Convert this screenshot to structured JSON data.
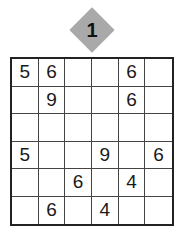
{
  "puzzle": {
    "number": "1",
    "badge_color": "#a9a9a9",
    "size": 6,
    "grid": [
      [
        "5",
        "6",
        "",
        "",
        "6",
        ""
      ],
      [
        "",
        "9",
        "",
        "",
        "6",
        ""
      ],
      [
        "",
        "",
        "",
        "",
        "",
        ""
      ],
      [
        "5",
        "",
        "",
        "9",
        "",
        "6"
      ],
      [
        "",
        "",
        "6",
        "",
        "4",
        ""
      ],
      [
        "",
        "6",
        "",
        "4",
        "",
        ""
      ]
    ]
  }
}
